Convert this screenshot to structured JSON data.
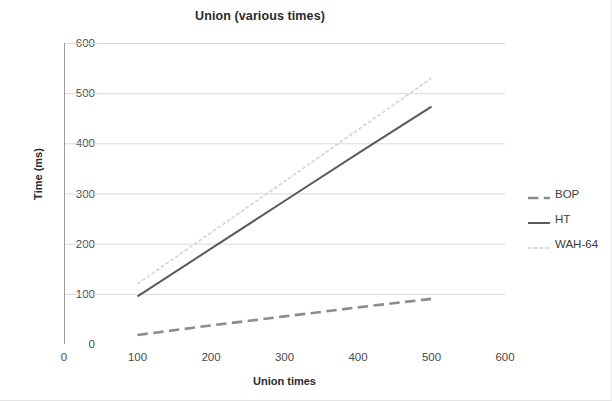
{
  "chart_data": {
    "type": "line",
    "title": "Union (various times)",
    "xlabel": "Union times",
    "ylabel": "Time (ms)",
    "xlim": [
      0,
      600
    ],
    "ylim": [
      0,
      600
    ],
    "x_ticks": [
      0,
      100,
      200,
      300,
      400,
      500,
      600
    ],
    "y_ticks": [
      0,
      100,
      200,
      300,
      400,
      500,
      600
    ],
    "x_tick_labels": [
      "0",
      "100",
      "200",
      "300",
      "400",
      "500",
      "600"
    ],
    "y_tick_labels": [
      "0",
      "100",
      "200",
      "300",
      "400",
      "500",
      "600"
    ],
    "grid": "horizontal",
    "legend_position": "right",
    "x": [
      100,
      200,
      300,
      400,
      500
    ],
    "series": [
      {
        "name": "BOP",
        "values": [
          18,
          37,
          55,
          73,
          90
        ],
        "color": "#8c8c8c",
        "style": "dashed",
        "width": 2.6
      },
      {
        "name": "HT",
        "values": [
          95,
          190,
          285,
          380,
          473
        ],
        "color": "#5a5a5a",
        "style": "solid",
        "width": 2.0
      },
      {
        "name": "WAH-64",
        "values": [
          120,
          222,
          324,
          427,
          530
        ],
        "color": "#cdcdcd",
        "style": "dotted",
        "width": 1.4
      }
    ]
  },
  "axis_colors": {
    "gridline": "#d9d9d9",
    "axis": "#9a9a9a",
    "tick_text": "#4a4a4a",
    "title_text": "#2b2b2b"
  }
}
